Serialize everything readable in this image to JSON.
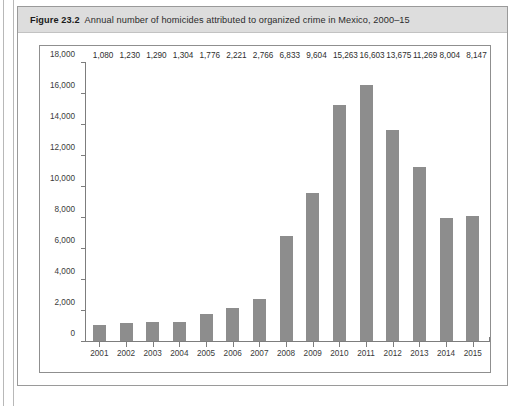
{
  "figure": {
    "number": "Figure 23.2",
    "caption": "Annual number of homicides attributed to organized crime in Mexico, 2000–15"
  },
  "colors": {
    "bar_fill": "#8d8d8d",
    "header_band": "#dddddd",
    "frame_border": "#8f8f8f",
    "axis_line": "#7d7d7d",
    "plot_background": "#ffffff"
  },
  "source_note": "",
  "chart_data": {
    "type": "bar",
    "title": "Annual number of homicides attributed to organized crime in Mexico, 2000–15",
    "xlabel": "",
    "ylabel": "",
    "ylim": [
      0,
      18000
    ],
    "ytick_step": 2000,
    "grid": false,
    "legend": null,
    "categories": [
      "2001",
      "2002",
      "2003",
      "2004",
      "2005",
      "2006",
      "2007",
      "2008",
      "2009",
      "2010",
      "2011",
      "2012",
      "2013",
      "2014",
      "2015"
    ],
    "values": [
      1080,
      1230,
      1290,
      1304,
      1776,
      2221,
      2766,
      6833,
      9604,
      15263,
      16603,
      13675,
      11269,
      8004,
      8147
    ],
    "data_labels": [
      "1,080",
      "1,230",
      "1,290",
      "1,304",
      "1,776",
      "2,221",
      "2,766",
      "6,833",
      "9,604",
      "15,263",
      "16,603",
      "13,675",
      "11,269",
      "8,004",
      "8,147"
    ],
    "ytick_labels": [
      "18,000",
      "16,000",
      "14,000",
      "12,000",
      "10,000",
      "8,000",
      "6,000",
      "4,000",
      "2,000",
      "0"
    ],
    "ytick_values": [
      18000,
      16000,
      14000,
      12000,
      10000,
      8000,
      6000,
      4000,
      2000,
      0
    ]
  }
}
